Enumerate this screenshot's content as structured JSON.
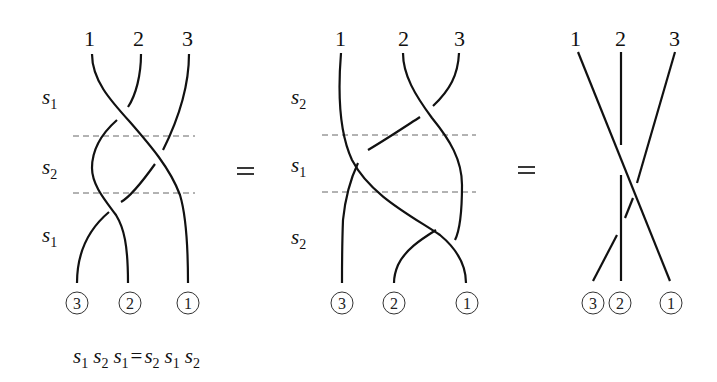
{
  "diagram": {
    "equation": {
      "lhs": [
        {
          "s": "s",
          "i": "1"
        },
        {
          "s": "s",
          "i": "2"
        },
        {
          "s": "s",
          "i": "1"
        }
      ],
      "op": "=",
      "rhs": [
        {
          "s": "s",
          "i": "2"
        },
        {
          "s": "s",
          "i": "1"
        },
        {
          "s": "s",
          "i": "2"
        }
      ]
    },
    "braids": [
      {
        "top_labels": [
          "1",
          "2",
          "3"
        ],
        "bottom_labels": [
          "3",
          "2",
          "1"
        ],
        "generators": [
          {
            "s": "s",
            "i": "1"
          },
          {
            "s": "s",
            "i": "2"
          },
          {
            "s": "s",
            "i": "1"
          }
        ]
      },
      {
        "top_labels": [
          "1",
          "2",
          "3"
        ],
        "bottom_labels": [
          "3",
          "2",
          "1"
        ],
        "generators": [
          {
            "s": "s",
            "i": "2"
          },
          {
            "s": "s",
            "i": "1"
          },
          {
            "s": "s",
            "i": "2"
          }
        ]
      },
      {
        "top_labels": [
          "1",
          "2",
          "3"
        ],
        "bottom_labels": [
          "3",
          "2",
          "1"
        ],
        "generators": []
      }
    ],
    "equals_signs": [
      "=",
      "="
    ]
  }
}
